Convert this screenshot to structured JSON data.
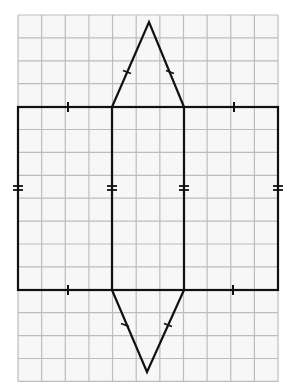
{
  "figure": {
    "description": "Net of a triangular prism drawn on square grid paper",
    "grid": {
      "columns": 11,
      "rows": 16,
      "origin_x": 18,
      "origin_y": 15,
      "cell_w": 23.64,
      "cell_h": 22.9,
      "line_color": "#bdbdbd",
      "background": "#f7f7f7"
    },
    "outline_color": "#111111",
    "rectangle": {
      "x1": 18,
      "y1": 107,
      "x2": 278,
      "y2": 290
    },
    "fold_lines": [
      112,
      184
    ],
    "top_triangle": {
      "base_left": [
        112,
        107
      ],
      "apex": [
        149,
        22
      ],
      "base_right": [
        184,
        107
      ]
    },
    "bottom_triangle": {
      "base_left": [
        112,
        290
      ],
      "apex": [
        147,
        372
      ],
      "base_right": [
        184,
        290
      ]
    },
    "single_ticks": [
      {
        "name": "top-left-edge-tick",
        "x": 68,
        "y": 107,
        "orient": "v"
      },
      {
        "name": "top-right-edge-tick",
        "x": 234,
        "y": 107,
        "orient": "v"
      },
      {
        "name": "bottom-left-edge-tick",
        "x": 68,
        "y": 290,
        "orient": "v"
      },
      {
        "name": "bottom-right-edge-tick",
        "x": 233,
        "y": 290,
        "orient": "v"
      }
    ],
    "triangle_ticks": [
      {
        "name": "top-triangle-left-side-tick",
        "x": 127,
        "y": 72
      },
      {
        "name": "top-triangle-right-side-tick",
        "x": 170,
        "y": 72
      },
      {
        "name": "bottom-triangle-left-side-tick",
        "x": 125,
        "y": 325
      },
      {
        "name": "bottom-triangle-right-side-tick",
        "x": 168,
        "y": 325
      }
    ],
    "double_ticks": [
      {
        "name": "left-side-double-tick",
        "x": 18,
        "y": 188
      },
      {
        "name": "fold-left-double-tick",
        "x": 112,
        "y": 188
      },
      {
        "name": "fold-right-double-tick",
        "x": 184,
        "y": 188
      },
      {
        "name": "right-side-double-tick",
        "x": 278,
        "y": 188
      }
    ]
  }
}
